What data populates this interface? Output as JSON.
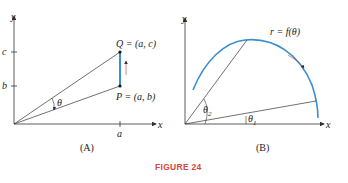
{
  "panel_a": {
    "caption": "(A)",
    "axis_x": "x",
    "axis_y": "y",
    "tick_x": "a",
    "tick_c": "c",
    "tick_b": "b",
    "point_q": "Q = (a, c)",
    "point_p": "P = (a, b)",
    "angle": "θ"
  },
  "panel_b": {
    "caption": "(B)",
    "axis_x": "x",
    "axis_y": "y",
    "curve_label": "r = f(θ)",
    "angle1": "θ",
    "angle1_sub": "1",
    "angle2": "θ",
    "angle2_sub": "2"
  },
  "figure_label": "FIGURE 24",
  "colors": {
    "curve": "#3a8fd0",
    "figure_label": "#d9443f",
    "line": "#333333"
  }
}
